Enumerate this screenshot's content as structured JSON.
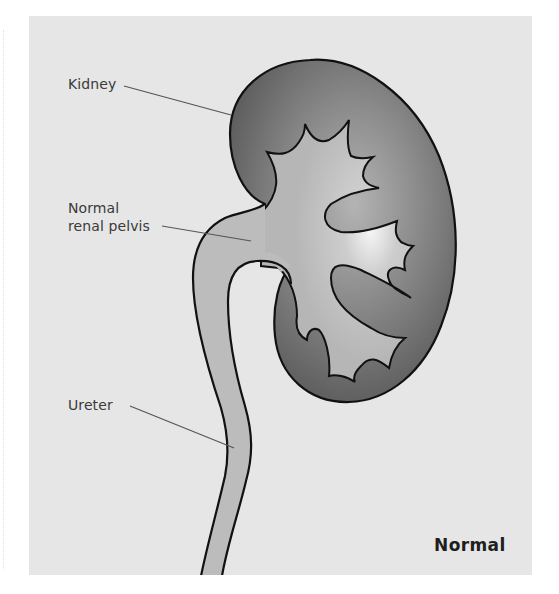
{
  "figure": {
    "caption": "Normal",
    "labels": {
      "kidney": "Kidney",
      "pelvis_line1": "Normal",
      "pelvis_line2": "renal pelvis",
      "ureter": "Ureter"
    },
    "colors": {
      "page_background": "#ffffff",
      "panel_background": "#e6e6e6",
      "kidney_cortex_dark": "#5e5e5e",
      "kidney_cortex_mid": "#8a8a8a",
      "pelvis_fill": "#bcbcbc",
      "highlight": "#f4f4f4",
      "outline": "#111111",
      "leader_line": "#555555",
      "text": "#3a3a3a"
    }
  }
}
